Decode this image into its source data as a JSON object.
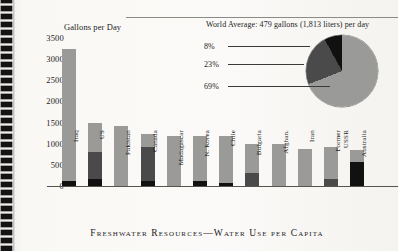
{
  "caption": "Freshwater Resources—Water Use per Capita",
  "chart_data": {
    "type": "bar",
    "title": "Gallons per Day",
    "xlabel": "",
    "ylabel": "Gallons per Day",
    "ylim": [
      0,
      3500
    ],
    "yticks": [
      0,
      500,
      1000,
      1500,
      2000,
      2500,
      3000,
      3500
    ],
    "grid": false,
    "stacked": true,
    "categories": [
      "Iraq",
      "US",
      "Pakistan",
      "Canada",
      "Madagascar",
      "N. Korea",
      "Chile",
      "Bulgaria",
      "Afghan.",
      "Iran",
      "Former USSR",
      "Australia"
    ],
    "series": [
      {
        "name": "Domestic",
        "color": "#111111",
        "values": [
          110,
          160,
          0,
          120,
          0,
          130,
          60,
          0,
          0,
          0,
          0,
          560
        ]
      },
      {
        "name": "Industrial",
        "color": "#4a4a4a",
        "values": [
          0,
          640,
          0,
          810,
          0,
          0,
          0,
          300,
          0,
          0,
          170,
          0
        ]
      },
      {
        "name": "Agricultural",
        "color": "#9a9a98",
        "values": [
          3140,
          690,
          1430,
          290,
          1190,
          1060,
          1130,
          700,
          1000,
          880,
          760,
          290
        ]
      }
    ],
    "totals": [
      3250,
      1490,
      1430,
      1220,
      1190,
      1190,
      1190,
      1000,
      1000,
      880,
      930,
      850
    ],
    "inset": {
      "type": "pie",
      "title": "World Average: 479 gallons (1,813 liters) per day",
      "labels": [
        "8%",
        "23%",
        "69%"
      ],
      "values": [
        8,
        23,
        69
      ],
      "colors": [
        "#111111",
        "#4a4a4a",
        "#9a9a98"
      ]
    }
  }
}
